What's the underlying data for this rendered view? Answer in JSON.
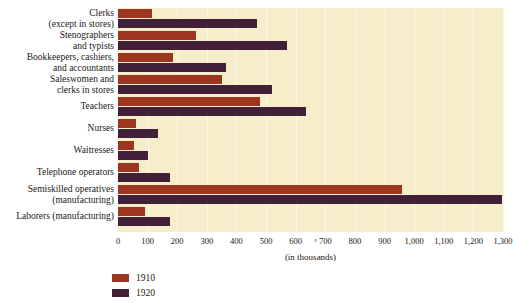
{
  "chart_data": {
    "type": "bar",
    "orientation": "horizontal",
    "title": "",
    "subtitle": "",
    "xlabel": "(in thousands)",
    "ylabel": "",
    "xlim": [
      0,
      1300
    ],
    "xticks": [
      0,
      100,
      200,
      300,
      400,
      500,
      600,
      700,
      800,
      900,
      1000,
      1100,
      1200,
      1300
    ],
    "xtick_labels": [
      "0",
      "100",
      "200",
      "300",
      "400",
      "500",
      "600",
      "700",
      "800",
      "900",
      "1,000",
      "1,100",
      "1,200",
      "1,300"
    ],
    "grid": "vertical",
    "legend_position": "bottom-left",
    "categories": [
      "Clerks (except in stores)",
      "Stenographers and typists",
      "Bookkeepers, cashiers, and accountants",
      "Saleswomen and clerks in stores",
      "Teachers",
      "Nurses",
      "Waitresses",
      "Telephone operators",
      "Semiskilled operatives (manufacturing)",
      "Laborers (manufacturing)"
    ],
    "category_lines": [
      [
        "Clerks",
        "(except in stores)"
      ],
      [
        "Stenographers",
        "and typists"
      ],
      [
        "Bookkeepers, cashiers,",
        "and accountants"
      ],
      [
        "Saleswomen and",
        "clerks in stores"
      ],
      [
        "Teachers",
        ""
      ],
      [
        "Nurses",
        ""
      ],
      [
        "Waitresses",
        ""
      ],
      [
        "Telephone operators",
        ""
      ],
      [
        "Semiskilled operatives",
        "(manufacturing)"
      ],
      [
        "Laborers (manufacturing)",
        ""
      ]
    ],
    "series": [
      {
        "name": "1910",
        "color": "#9e3520",
        "values": [
          115,
          265,
          185,
          350,
          480,
          60,
          55,
          70,
          960,
          90
        ]
      },
      {
        "name": "1920",
        "color": "#42203a",
        "values": [
          470,
          570,
          365,
          520,
          635,
          135,
          100,
          175,
          1295,
          175
        ]
      }
    ]
  },
  "legend": {
    "items": [
      {
        "label": "1910",
        "color": "#9e3520"
      },
      {
        "label": "1920",
        "color": "#42203a"
      }
    ]
  },
  "axis": {
    "title": "(in thousands)",
    "stray_mark": "°"
  },
  "colors": {
    "plot_background": "#f6eecb",
    "gridline": "#fdf8e4",
    "page_background": "#ffffff",
    "text": "#1c1713",
    "series_1910": "#9e3520",
    "series_1920": "#42203a"
  }
}
